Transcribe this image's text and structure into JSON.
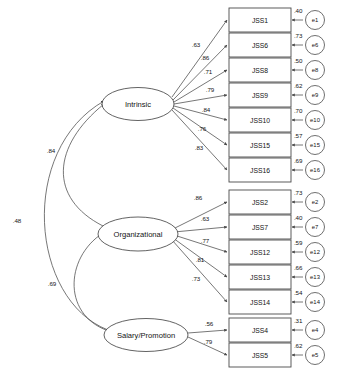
{
  "diagram": {
    "type": "structural-equation-model",
    "factors": [
      {
        "id": "intrinsic",
        "label": "Intrinsic"
      },
      {
        "id": "organizational",
        "label": "Organizational"
      },
      {
        "id": "salary",
        "label": "Salary/Promotion"
      }
    ],
    "indicators": [
      {
        "id": "JSS1",
        "label": "JSS1",
        "factor": "intrinsic",
        "loading": ".63",
        "error": "e1",
        "residual": ".40"
      },
      {
        "id": "JSS6",
        "label": "JSS6",
        "factor": "intrinsic",
        "loading": ".86",
        "error": "e6",
        "residual": ".73"
      },
      {
        "id": "JSS8",
        "label": "JSS8",
        "factor": "intrinsic",
        "loading": ".71",
        "error": "e8",
        "residual": ".50"
      },
      {
        "id": "JSS9",
        "label": "JSS9",
        "factor": "intrinsic",
        "loading": ".79",
        "error": "e9",
        "residual": ".62"
      },
      {
        "id": "JSS10",
        "label": "JSS10",
        "factor": "intrinsic",
        "loading": ".84",
        "error": "e10",
        "residual": ".70"
      },
      {
        "id": "JSS15",
        "label": "JSS15",
        "factor": "intrinsic",
        "loading": ".76",
        "error": "e15",
        "residual": ".57"
      },
      {
        "id": "JSS16",
        "label": "JSS16",
        "factor": "intrinsic",
        "loading": ".83",
        "error": "e16",
        "residual": ".69"
      },
      {
        "id": "JSS2",
        "label": "JSS2",
        "factor": "organizational",
        "loading": ".86",
        "error": "e2",
        "residual": ".73"
      },
      {
        "id": "JSS7",
        "label": "JSS7",
        "factor": "organizational",
        "loading": ".63",
        "error": "e7",
        "residual": ".40"
      },
      {
        "id": "JSS12",
        "label": "JSS12",
        "factor": "organizational",
        "loading": ".77",
        "error": "e12",
        "residual": ".59"
      },
      {
        "id": "JSS13",
        "label": "JSS13",
        "factor": "organizational",
        "loading": ".81",
        "error": "e13",
        "residual": ".66"
      },
      {
        "id": "JSS14",
        "label": "JSS14",
        "factor": "organizational",
        "loading": ".73",
        "error": "e14",
        "residual": ".54"
      },
      {
        "id": "JSS4",
        "label": "JSS4",
        "factor": "salary",
        "loading": ".56",
        "error": "e4",
        "residual": ".31"
      },
      {
        "id": "JSS5",
        "label": "JSS5",
        "factor": "salary",
        "loading": ".79",
        "error": "e5",
        "residual": ".62"
      }
    ],
    "correlations": [
      {
        "id": "corr-intrinsic-organizational",
        "from": "intrinsic",
        "to": "organizational",
        "value": ".84"
      },
      {
        "id": "corr-intrinsic-salary",
        "from": "intrinsic",
        "to": "salary",
        "value": ".48"
      },
      {
        "id": "corr-organizational-salary",
        "from": "organizational",
        "to": "salary",
        "value": ".69"
      }
    ]
  },
  "colors": {
    "stroke": "#4a4a4a",
    "text": "#141414",
    "background": "#ffffff"
  }
}
